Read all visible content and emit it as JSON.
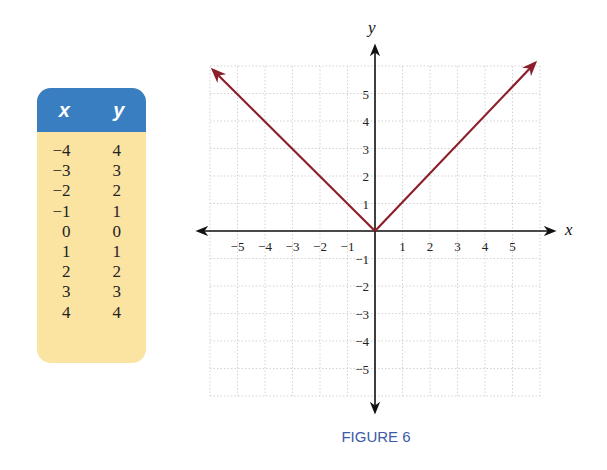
{
  "table": {
    "headers": {
      "x": "x",
      "y": "y"
    },
    "rows": [
      {
        "x": "−4",
        "y": "4"
      },
      {
        "x": "−3",
        "y": "3"
      },
      {
        "x": "−2",
        "y": "2"
      },
      {
        "x": "−1",
        "y": "1"
      },
      {
        "x": "0",
        "y": "0"
      },
      {
        "x": "1",
        "y": "1"
      },
      {
        "x": "2",
        "y": "2"
      },
      {
        "x": "3",
        "y": "3"
      },
      {
        "x": "4",
        "y": "4"
      }
    ]
  },
  "graph": {
    "x_axis_label": "x",
    "y_axis_label": "y",
    "x_ticks": [
      "−5",
      "−4",
      "−3",
      "−2",
      "−1",
      "1",
      "2",
      "3",
      "4",
      "5"
    ],
    "y_ticks": [
      "5",
      "4",
      "3",
      "2",
      "1",
      "−1",
      "−2",
      "−3",
      "−4",
      "−5"
    ],
    "line_color": "#8b1f2a"
  },
  "caption": "FIGURE 6",
  "chart_data": {
    "type": "line",
    "title": "FIGURE 6",
    "xlabel": "x",
    "ylabel": "y",
    "xlim": [
      -6,
      6
    ],
    "ylim": [
      -6,
      6
    ],
    "grid": true,
    "x": [
      -4,
      -3,
      -2,
      -1,
      0,
      1,
      2,
      3,
      4
    ],
    "series": [
      {
        "name": "y = |x|",
        "values": [
          4,
          3,
          2,
          1,
          0,
          1,
          2,
          3,
          4
        ],
        "color": "#8b1f2a"
      }
    ],
    "annotations": [
      "Arrows at both ends of the V indicate the graph continues"
    ]
  }
}
